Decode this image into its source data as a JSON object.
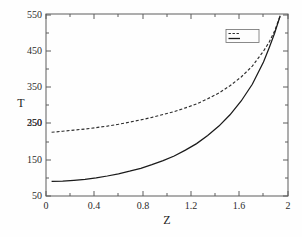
{
  "chart_data": {
    "type": "line",
    "title": "",
    "xlabel": "Z",
    "ylabel": "T",
    "xlim": [
      -0.05,
      2.12
    ],
    "ylim": [
      50,
      550
    ],
    "grid": false,
    "legend_position": "top-right",
    "xticks": [
      "0",
      "0.4",
      "0.8",
      "1.2",
      "1.6",
      "2"
    ],
    "xtick_values": [
      0,
      0.4,
      0.8,
      1.2,
      1.6,
      2
    ],
    "yticks": [
      "50",
      "150",
      "250",
      "350",
      "450",
      "550"
    ],
    "ytick_values": [
      50,
      150,
      250,
      350,
      450,
      550
    ],
    "series": [
      {
        "name": "",
        "style": "dashed",
        "color": "#2e2e2e",
        "x": [
          0,
          0.1,
          0.2,
          0.3,
          0.4,
          0.5,
          0.6,
          0.7,
          0.8,
          0.9,
          1.0,
          1.1,
          1.2,
          1.3,
          1.4,
          1.5,
          1.6,
          1.7,
          1.8,
          1.9,
          1.95,
          2.0,
          2.05
        ],
        "values": [
          225,
          228,
          231,
          234,
          238,
          242,
          247,
          253,
          259,
          266,
          274,
          282,
          292,
          303,
          317,
          333,
          353,
          377,
          407,
          448,
          472,
          503,
          545
        ]
      },
      {
        "name": "",
        "style": "solid",
        "color": "#1a1a1a",
        "x": [
          0,
          0.1,
          0.2,
          0.3,
          0.4,
          0.5,
          0.6,
          0.7,
          0.8,
          0.9,
          1.0,
          1.1,
          1.2,
          1.3,
          1.4,
          1.5,
          1.6,
          1.7,
          1.8,
          1.9,
          1.95,
          2.0,
          2.05
        ],
        "values": [
          90,
          91,
          93,
          96,
          100,
          105,
          111,
          118,
          126,
          136,
          147,
          160,
          176,
          194,
          216,
          242,
          273,
          311,
          357,
          418,
          456,
          497,
          545
        ]
      }
    ]
  },
  "axes": {
    "x_label": "Z",
    "y_label": "T",
    "x_tick_labels": [
      "0",
      "0.4",
      "0.8",
      "1.2",
      "1.6",
      "2"
    ],
    "y_tick_labels": [
      "50",
      "150",
      "250",
      "350",
      "450",
      "550"
    ]
  },
  "legend": {
    "entry_dashed_label": "",
    "entry_solid_label": ""
  }
}
